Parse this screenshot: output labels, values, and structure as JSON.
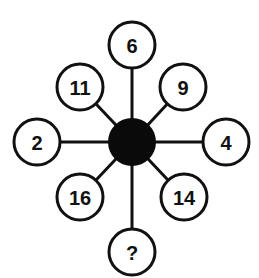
{
  "diagram": {
    "type": "number-wheel-puzzle",
    "hub": {
      "x": 132,
      "y": 142,
      "r": 24,
      "color": "#0a0a0a"
    },
    "node_radius": 23,
    "nodes": [
      {
        "id": "top",
        "label": "6",
        "x": 132,
        "y": 45
      },
      {
        "id": "top-right",
        "label": "9",
        "x": 183,
        "y": 87
      },
      {
        "id": "right",
        "label": "4",
        "x": 226,
        "y": 142
      },
      {
        "id": "bottom-right",
        "label": "14",
        "x": 184,
        "y": 197
      },
      {
        "id": "bottom",
        "label": "?",
        "x": 132,
        "y": 252
      },
      {
        "id": "bottom-left",
        "label": "16",
        "x": 80,
        "y": 197
      },
      {
        "id": "left",
        "label": "2",
        "x": 37,
        "y": 142
      },
      {
        "id": "top-left",
        "label": "11",
        "x": 80,
        "y": 87
      }
    ],
    "line_color": "#111111",
    "fill_color": "#ffffff"
  }
}
